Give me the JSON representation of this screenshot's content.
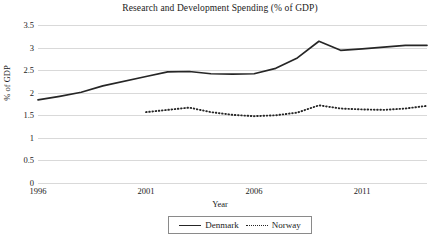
{
  "chart_data": {
    "type": "line",
    "title": "Research and Development Spending (% of GDP)",
    "xlabel": "Year",
    "ylabel": "% of GDP",
    "xlim": [
      1996,
      2014
    ],
    "ylim": [
      0,
      3.5
    ],
    "ytick_labels": [
      "0",
      "0.5",
      "1",
      "1.5",
      "2",
      "2.5",
      "3",
      "3.5"
    ],
    "ytick_values": [
      0,
      0.5,
      1,
      1.5,
      2,
      2.5,
      3,
      3.5
    ],
    "xtick_labels": [
      "1996",
      "2001",
      "2006",
      "2011"
    ],
    "xtick_values": [
      1996,
      2001,
      2006,
      2011
    ],
    "grid": true,
    "legend_position": "bottom",
    "series": [
      {
        "name": "Denmark",
        "style": "solid",
        "color": "#262626",
        "x": [
          1996,
          1997,
          1998,
          1999,
          2001,
          2002,
          2003,
          2004,
          2005,
          2006,
          2007,
          2008,
          2009,
          2010,
          2011,
          2012,
          2013,
          2014
        ],
        "values": [
          1.84,
          1.92,
          2.01,
          2.15,
          2.36,
          2.46,
          2.47,
          2.42,
          2.41,
          2.42,
          2.54,
          2.77,
          3.14,
          2.94,
          2.97,
          3.01,
          3.05,
          3.05
        ]
      },
      {
        "name": "Norway",
        "style": "dotted",
        "color": "#262626",
        "x": [
          2001,
          2002,
          2003,
          2004,
          2005,
          2006,
          2007,
          2008,
          2009,
          2010,
          2011,
          2012,
          2013,
          2014
        ],
        "values": [
          1.57,
          1.62,
          1.67,
          1.57,
          1.51,
          1.48,
          1.5,
          1.56,
          1.72,
          1.65,
          1.63,
          1.62,
          1.65,
          1.71
        ]
      }
    ]
  },
  "legend": {
    "entries": [
      {
        "label": "Denmark"
      },
      {
        "label": "Norway"
      }
    ]
  }
}
